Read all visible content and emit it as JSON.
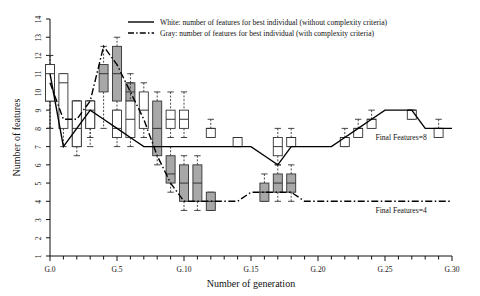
{
  "chart_data": {
    "type": "line",
    "title": "",
    "xlabel": "Number of generation",
    "ylabel": "Number of features",
    "xlim": [
      0,
      30
    ],
    "ylim": [
      1,
      14
    ],
    "grid": false,
    "legend_position": "top-center",
    "xticks": [
      0,
      5,
      10,
      15,
      20,
      25,
      30
    ],
    "xticklabels": [
      "G.0",
      "G.5",
      "G.10",
      "G.15",
      "G.20",
      "G.25",
      "G.30"
    ],
    "x_minor_tick_step": 1,
    "yticks": [
      1,
      2,
      3,
      4,
      5,
      6,
      7,
      8,
      9,
      10,
      11,
      12,
      13,
      14
    ],
    "yticklabels": [
      "1",
      "2",
      "3",
      "4",
      "5",
      "6",
      "7",
      "8",
      "9",
      "10",
      "11",
      "12",
      "13",
      "14"
    ],
    "legend": [
      {
        "key": "white",
        "label": "White: number of features for best individual (without complexity criteria)",
        "linestyle": "solid",
        "color": "#000000",
        "box_fill": "#ffffff"
      },
      {
        "key": "gray",
        "label": "Gray: number of features for best individual (with complexity criteria)",
        "linestyle": "dashdot",
        "color": "#000000",
        "box_fill": "#a8a8a8"
      }
    ],
    "annotations": [
      {
        "text": "Final Features=8",
        "x": 26.2,
        "y": 7.35,
        "series": "white"
      },
      {
        "text": "Final Features=4",
        "x": 26.2,
        "y": 3.35,
        "series": "gray"
      }
    ],
    "series": [
      {
        "name": "White: best individual (without complexity criteria)",
        "key": "white",
        "linestyle": "solid",
        "x": [
          0,
          1,
          2,
          3,
          4,
          5,
          6,
          7,
          8,
          9,
          10,
          11,
          12,
          13,
          14,
          15,
          16,
          17,
          18,
          19,
          20,
          21,
          22,
          23,
          24,
          25,
          26,
          27,
          28,
          29,
          30
        ],
        "values": [
          11,
          7,
          8,
          9,
          8.5,
          8,
          7.5,
          7,
          7,
          7,
          7,
          7,
          7,
          7,
          7,
          7,
          6.5,
          6,
          7,
          7,
          7,
          7,
          7.5,
          8,
          8.5,
          9,
          9,
          9,
          8,
          8,
          8
        ]
      },
      {
        "name": "Gray: best individual (with complexity criteria)",
        "key": "gray",
        "linestyle": "dashdot",
        "x": [
          0,
          1,
          2,
          3,
          4,
          5,
          6,
          7,
          8,
          9,
          10,
          11,
          12,
          13,
          14,
          15,
          16,
          17,
          18,
          19,
          20,
          21,
          22,
          23,
          24,
          25,
          26,
          27,
          28,
          29,
          30
        ],
        "values": [
          10.5,
          8.5,
          8.5,
          9.5,
          12.5,
          11.5,
          10,
          8.5,
          6.5,
          5,
          4,
          4,
          4,
          4,
          4,
          4.5,
          4.5,
          4.5,
          4.5,
          4,
          4,
          4,
          4,
          4,
          4,
          4,
          4,
          4,
          4,
          4,
          4
        ]
      }
    ],
    "boxplots_white": [
      {
        "x": 0,
        "q1": 9.5,
        "median": 11.0,
        "q3": 11.5,
        "low": 8.0,
        "high": 12.0
      },
      {
        "x": 1,
        "q1": 8.0,
        "median": 10.5,
        "q3": 11.0,
        "low": 7.0,
        "high": 11.0
      },
      {
        "x": 2,
        "q1": 7.0,
        "median": 8.0,
        "q3": 9.5,
        "low": 7.0,
        "high": 9.5
      },
      {
        "x": 3,
        "q1": 8.0,
        "median": 9.0,
        "q3": 9.5,
        "low": 7.0,
        "high": 9.5
      },
      {
        "x": 5,
        "q1": 7.5,
        "median": 8.0,
        "q3": 9.0,
        "low": 7.0,
        "high": 9.0
      },
      {
        "x": 6,
        "q1": 7.5,
        "median": 8.5,
        "q3": 9.5,
        "low": 7.0,
        "high": 10.5
      },
      {
        "x": 7,
        "q1": 8.0,
        "median": 9.0,
        "q3": 10.0,
        "low": 7.5,
        "high": 10.5
      },
      {
        "x": 9,
        "q1": 8.0,
        "median": 8.5,
        "q3": 9.0,
        "low": 7.5,
        "high": 10.0
      },
      {
        "x": 10,
        "q1": 8.0,
        "median": 8.5,
        "q3": 9.0,
        "low": 7.5,
        "high": 10.0
      },
      {
        "x": 12,
        "q1": 7.5,
        "median": 8.0,
        "q3": 8.0,
        "low": 7.5,
        "high": 8.5
      },
      {
        "x": 14,
        "q1": 7.0,
        "median": 7.5,
        "q3": 7.5,
        "low": 7.0,
        "high": 7.5
      },
      {
        "x": 17,
        "q1": 6.5,
        "median": 7.0,
        "q3": 7.5,
        "low": 6.0,
        "high": 8.0
      },
      {
        "x": 18,
        "q1": 7.0,
        "median": 7.5,
        "q3": 7.5,
        "low": 7.0,
        "high": 8.0
      },
      {
        "x": 22,
        "q1": 7.0,
        "median": 7.5,
        "q3": 7.5,
        "low": 7.0,
        "high": 8.0
      },
      {
        "x": 23,
        "q1": 7.5,
        "median": 8.0,
        "q3": 8.0,
        "low": 7.5,
        "high": 8.5
      },
      {
        "x": 24,
        "q1": 8.0,
        "median": 8.5,
        "q3": 8.5,
        "low": 8.0,
        "high": 9.0
      },
      {
        "x": 27,
        "q1": 8.5,
        "median": 9.0,
        "q3": 9.0,
        "low": 8.5,
        "high": 9.0
      },
      {
        "x": 29,
        "q1": 7.5,
        "median": 8.0,
        "q3": 8.0,
        "low": 7.5,
        "high": 8.5
      }
    ],
    "boxplots_gray": [
      {
        "x": 0,
        "q1": 9.5,
        "median": 10.0,
        "q3": 11.5,
        "low": 8.0,
        "high": 12.0
      },
      {
        "x": 2,
        "q1": 7.0,
        "median": 8.5,
        "q3": 9.5,
        "low": 6.5,
        "high": 9.5
      },
      {
        "x": 3,
        "q1": 8.0,
        "median": 9.0,
        "q3": 9.5,
        "low": 7.5,
        "high": 9.5
      },
      {
        "x": 4,
        "q1": 10.0,
        "median": 11.0,
        "q3": 11.5,
        "low": 8.0,
        "high": 12.5
      },
      {
        "x": 5,
        "q1": 9.5,
        "median": 11.0,
        "q3": 12.5,
        "low": 8.5,
        "high": 13.0
      },
      {
        "x": 6,
        "q1": 9.5,
        "median": 10.0,
        "q3": 10.5,
        "low": 9.0,
        "high": 11.0
      },
      {
        "x": 8,
        "q1": 6.5,
        "median": 8.0,
        "q3": 9.5,
        "low": 6.0,
        "high": 10.0
      },
      {
        "x": 9,
        "q1": 5.0,
        "median": 5.5,
        "q3": 6.5,
        "low": 4.5,
        "high": 7.0
      },
      {
        "x": 10,
        "q1": 4.0,
        "median": 5.0,
        "q3": 6.0,
        "low": 3.5,
        "high": 6.5
      },
      {
        "x": 11,
        "q1": 4.0,
        "median": 5.0,
        "q3": 6.0,
        "low": 3.5,
        "high": 6.5
      },
      {
        "x": 12,
        "q1": 3.5,
        "median": 4.0,
        "q3": 4.5,
        "low": 3.5,
        "high": 4.5
      },
      {
        "x": 16,
        "q1": 4.0,
        "median": 4.5,
        "q3": 5.0,
        "low": 4.0,
        "high": 5.5
      },
      {
        "x": 17,
        "q1": 4.5,
        "median": 5.0,
        "q3": 5.5,
        "low": 4.0,
        "high": 6.0
      },
      {
        "x": 18,
        "q1": 4.5,
        "median": 5.0,
        "q3": 5.5,
        "low": 4.0,
        "high": 6.0
      }
    ]
  }
}
